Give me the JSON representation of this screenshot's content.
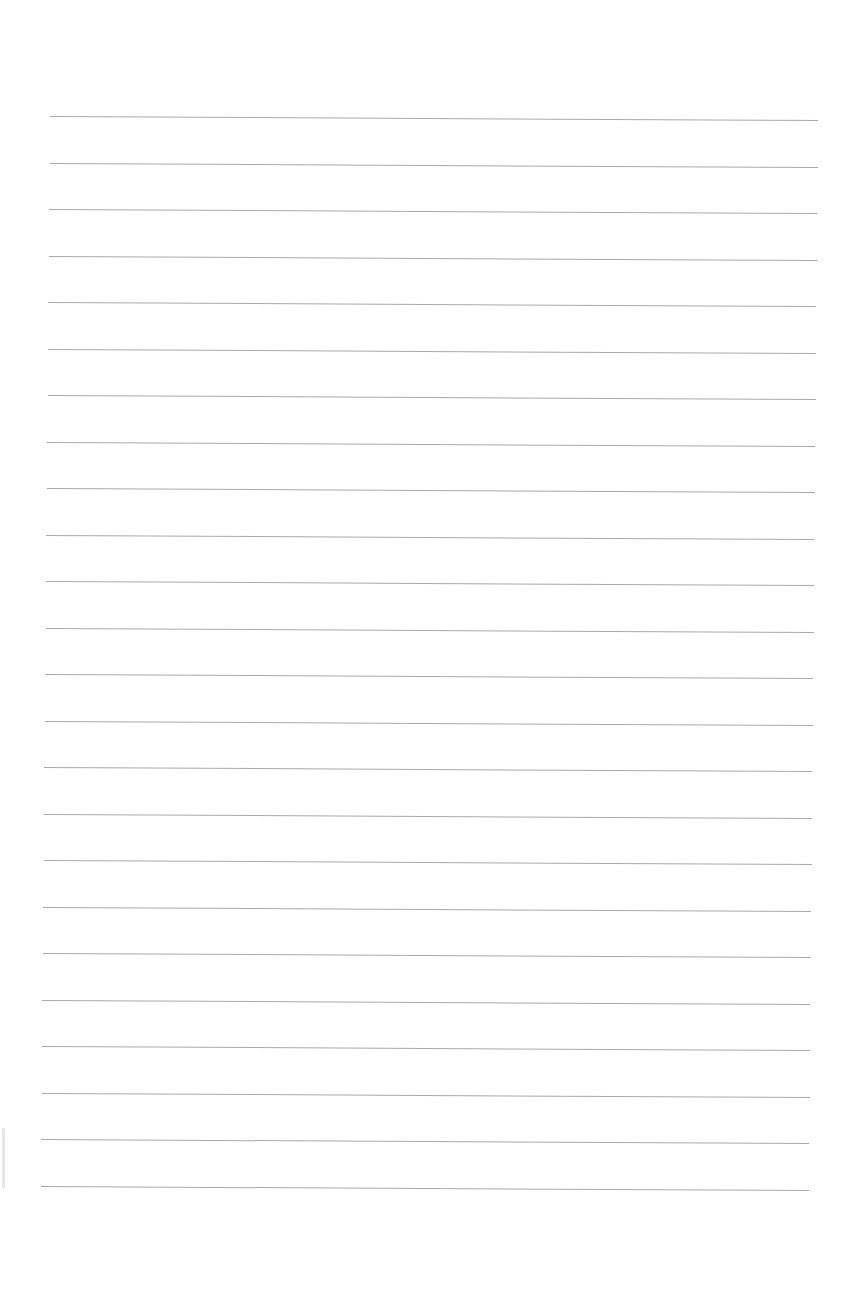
{
  "document": {
    "type": "blank lined notebook page",
    "background_color": "#ffffff",
    "line_color": "#9a9a9a",
    "line_count": 24,
    "line_spacing_px": 46.5,
    "first_line_y": 116,
    "line_left_x": 50,
    "line_right_x": 818
  }
}
